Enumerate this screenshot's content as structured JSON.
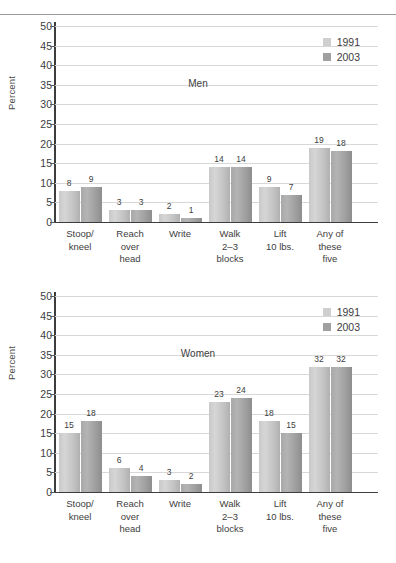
{
  "page": {
    "has_top_rule": true
  },
  "legend": {
    "items": [
      {
        "label": "1991",
        "color": "#cfcfcf"
      },
      {
        "label": "2003",
        "color": "#a0a0a0"
      }
    ]
  },
  "axis": {
    "ylabel": "Percent",
    "ticks": [
      "50",
      "45",
      "40",
      "35",
      "30",
      "25",
      "20",
      "15",
      "10",
      "5",
      "0"
    ]
  },
  "categories": [
    "Stoop/\nkneel",
    "Reach\nover\nhead",
    "Write",
    "Walk\n2–3\nblocks",
    "Lift\n10 lbs.",
    "Any of\nthese\nfive"
  ],
  "panels": [
    {
      "id": "men",
      "title": "Men",
      "labels_1991": [
        "8",
        "3",
        "2",
        "14",
        "9",
        "19"
      ],
      "labels_2003": [
        "9",
        "3",
        "1",
        "14",
        "7",
        "18"
      ]
    },
    {
      "id": "women",
      "title": "Women",
      "labels_1991": [
        "15",
        "6",
        "3",
        "23",
        "18",
        "32"
      ],
      "labels_2003": [
        "18",
        "4",
        "2",
        "24",
        "15",
        "32"
      ]
    }
  ],
  "chart_data": [
    {
      "type": "bar",
      "title": "Men",
      "categories": [
        "Stoop/kneel",
        "Reach over head",
        "Write",
        "Walk 2–3 blocks",
        "Lift 10 lbs.",
        "Any of these five"
      ],
      "series": [
        {
          "name": "1991",
          "values": [
            8,
            3,
            2,
            14,
            9,
            19
          ],
          "color": "#cfcfcf"
        },
        {
          "name": "2003",
          "values": [
            9,
            3,
            1,
            14,
            7,
            18
          ],
          "color": "#a0a0a0"
        }
      ],
      "xlabel": "",
      "ylabel": "Percent",
      "ylim": [
        0,
        50
      ],
      "ytick_step": 5,
      "grid": true,
      "legend_position": "top-right"
    },
    {
      "type": "bar",
      "title": "Women",
      "categories": [
        "Stoop/kneel",
        "Reach over head",
        "Write",
        "Walk 2–3 blocks",
        "Lift 10 lbs.",
        "Any of these five"
      ],
      "series": [
        {
          "name": "1991",
          "values": [
            15,
            6,
            3,
            23,
            18,
            32
          ],
          "color": "#cfcfcf"
        },
        {
          "name": "2003",
          "values": [
            18,
            4,
            2,
            24,
            15,
            32
          ],
          "color": "#a0a0a0"
        }
      ],
      "xlabel": "",
      "ylabel": "Percent",
      "ylim": [
        0,
        50
      ],
      "ytick_step": 5,
      "grid": true,
      "legend_position": "top-right"
    }
  ]
}
